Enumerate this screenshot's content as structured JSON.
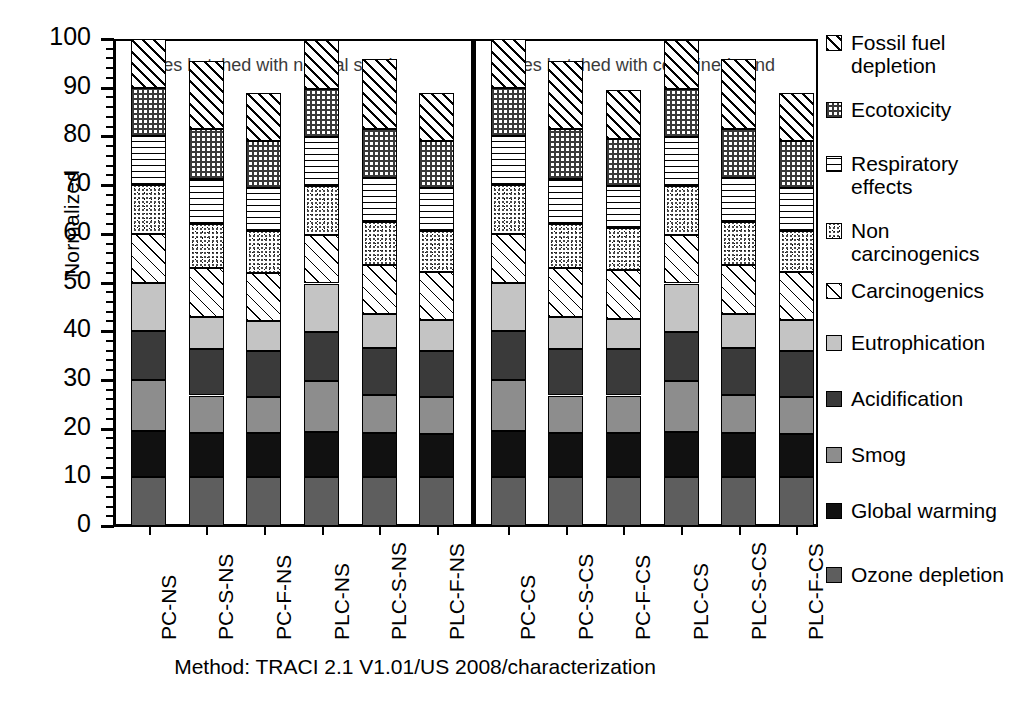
{
  "chart_data": {
    "type": "bar",
    "subtype": "stacked-bar",
    "title": "",
    "xlabel": "",
    "ylabel": "Normalized",
    "ylim": [
      0,
      100
    ],
    "yticks": [
      0,
      10,
      20,
      30,
      40,
      50,
      60,
      70,
      80,
      90,
      100
    ],
    "grid": false,
    "legend_position": "right",
    "caption": "Method: TRACI 2.1 V1.01/US 2008/characterization",
    "annotations": [
      {
        "text": "Mixes batched with natural sand",
        "group": "natural-sand"
      },
      {
        "text": "Mixes batched with combined sand",
        "group": "combined-sand"
      }
    ],
    "categories": [
      "PC-NS",
      "PC-S-NS",
      "PC-F-NS",
      "PLC-NS",
      "PLC-S-NS",
      "PLC-F-NS",
      "PC-CS",
      "PC-S-CS",
      "PC-F-CS",
      "PLC-CS",
      "PLC-S-CS",
      "PLC-F-CS"
    ],
    "series": [
      {
        "name": "Ozone depletion",
        "key": "ozone",
        "values": [
          10.0,
          10.0,
          10.0,
          10.0,
          10.0,
          10.0,
          10.0,
          10.0,
          10.0,
          10.0,
          10.0,
          10.0
        ]
      },
      {
        "name": "Global warming",
        "key": "gw",
        "values": [
          9.6,
          9.0,
          9.0,
          9.4,
          9.0,
          8.9,
          9.6,
          9.0,
          9.2,
          9.4,
          9.0,
          8.9
        ]
      },
      {
        "name": "Smog",
        "key": "smog",
        "values": [
          10.4,
          7.8,
          7.5,
          10.4,
          8.0,
          7.6,
          10.4,
          7.8,
          7.6,
          10.4,
          8.0,
          7.6
        ]
      },
      {
        "name": "Acidification",
        "key": "acid",
        "values": [
          10.0,
          9.6,
          9.5,
          10.0,
          9.5,
          9.5,
          10.0,
          9.6,
          9.5,
          10.0,
          9.5,
          9.5
        ]
      },
      {
        "name": "Eutrophication",
        "key": "eutro",
        "values": [
          10.0,
          6.6,
          6.2,
          10.0,
          7.0,
          6.3,
          10.0,
          6.6,
          6.3,
          10.0,
          7.0,
          6.3
        ]
      },
      {
        "name": "Carcinogenics",
        "key": "carc",
        "values": [
          10.0,
          10.0,
          9.8,
          10.0,
          10.0,
          9.8,
          10.0,
          10.0,
          9.9,
          10.0,
          10.0,
          9.8
        ]
      },
      {
        "name": "Non carcinogenics",
        "key": "noncarc",
        "values": [
          10.0,
          9.0,
          8.6,
          10.0,
          9.0,
          8.5,
          10.0,
          9.0,
          8.6,
          10.0,
          9.0,
          8.5
        ]
      },
      {
        "name": "Respiratory effects",
        "key": "resp",
        "values": [
          10.0,
          9.3,
          8.8,
          10.0,
          9.0,
          8.8,
          10.0,
          9.3,
          8.8,
          10.0,
          9.0,
          8.8
        ]
      },
      {
        "name": "Ecotoxicity",
        "key": "eco",
        "values": [
          10.0,
          10.2,
          9.6,
          10.0,
          10.0,
          9.6,
          10.0,
          10.2,
          9.6,
          10.0,
          10.0,
          9.6
        ]
      },
      {
        "name": "Fossil fuel depletion",
        "key": "fossil",
        "values": [
          10.0,
          14.0,
          10.0,
          10.0,
          14.5,
          10.0,
          10.0,
          14.0,
          10.0,
          10.0,
          14.5,
          10.0
        ]
      }
    ],
    "totals": [
      100.0,
      95.5,
      89.0,
      100.0,
      96.5,
      89.0,
      100.0,
      95.5,
      89.5,
      100.0,
      96.5,
      89.0
    ]
  },
  "axis": {
    "ylabel": "Normalized",
    "ticks": [
      "100",
      "90",
      "80",
      "70",
      "60",
      "50",
      "40",
      "30",
      "20",
      "10",
      "0"
    ]
  },
  "legend": {
    "items": [
      {
        "label": "Fossil fuel depletion",
        "key": "fossil"
      },
      {
        "label": "Ecotoxicity",
        "key": "eco"
      },
      {
        "label": "Respiratory effects",
        "key": "resp"
      },
      {
        "label": "Non carcinogenics",
        "key": "noncarc"
      },
      {
        "label": "Carcinogenics",
        "key": "carc"
      },
      {
        "label": "Eutrophication",
        "key": "eutro"
      },
      {
        "label": "Acidification",
        "key": "acid"
      },
      {
        "label": "Smog",
        "key": "smog"
      },
      {
        "label": "Global warming",
        "key": "gw"
      },
      {
        "label": "Ozone depletion",
        "key": "ozone"
      }
    ]
  },
  "notes": {
    "natural": "Mixes batched with natural sand",
    "combined": "Mixes batched with combined sand"
  },
  "caption": "Method: TRACI 2.1 V1.01/US 2008/characterization"
}
